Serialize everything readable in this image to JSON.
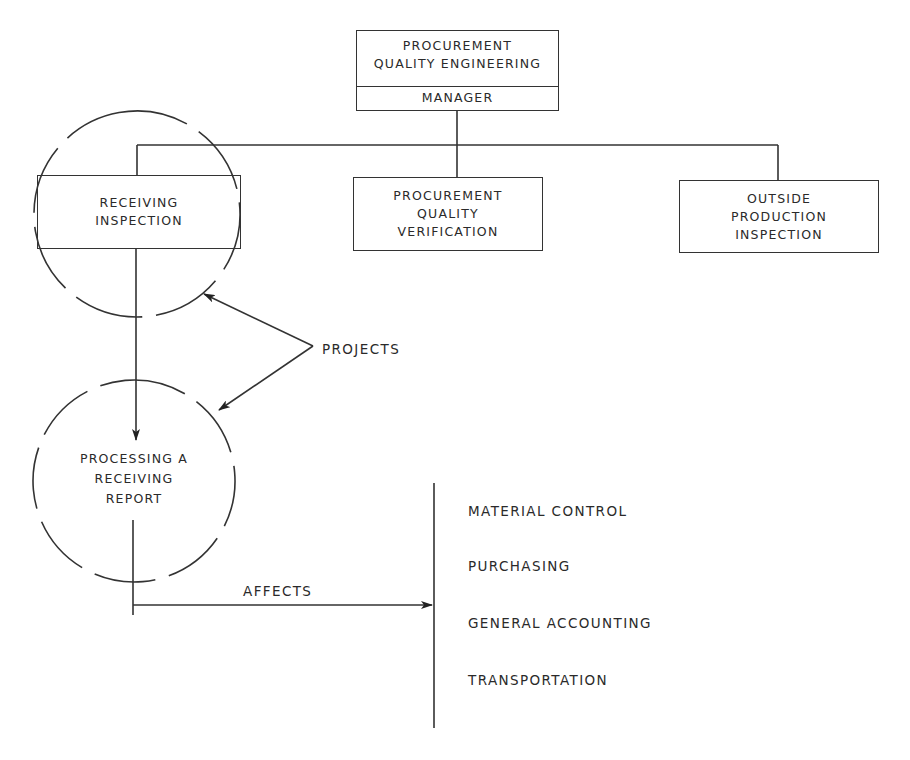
{
  "top_box": {
    "title_lines": [
      "PROCUREMENT",
      "QUALITY ENGINEERING"
    ],
    "role": "MANAGER"
  },
  "departments": [
    {
      "lines": [
        "RECEIVING",
        "INSPECTION"
      ]
    },
    {
      "lines": [
        "PROCUREMENT",
        "QUALITY",
        "VERIFICATION"
      ]
    },
    {
      "lines": [
        "OUTSIDE",
        "PRODUCTION",
        "INSPECTION"
      ]
    }
  ],
  "projects_label": "PROJECTS",
  "process_circle": {
    "lines": [
      "PROCESSING A",
      "RECEIVING",
      "REPORT"
    ]
  },
  "affects_label": "AFFECTS",
  "affected_areas": [
    "MATERIAL CONTROL",
    "PURCHASING",
    "GENERAL ACCOUNTING",
    "TRANSPORTATION"
  ]
}
